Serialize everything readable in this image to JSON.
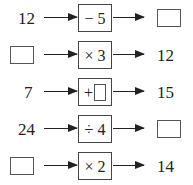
{
  "rows": [
    {
      "input": "12",
      "operator": "− 5",
      "output": "",
      "input_blank": false,
      "output_blank": true
    },
    {
      "input": "",
      "operator": "× 3",
      "output": "12",
      "input_blank": true,
      "output_blank": false
    },
    {
      "input": "7",
      "operator": "+",
      "operator_blank": true,
      "output": "15",
      "input_blank": false,
      "output_blank": false
    },
    {
      "input": "24",
      "operator": "÷ 4",
      "output": "",
      "input_blank": false,
      "output_blank": true
    },
    {
      "input": "",
      "operator": "× 2",
      "output": "14",
      "input_blank": true,
      "output_blank": false
    }
  ]
}
